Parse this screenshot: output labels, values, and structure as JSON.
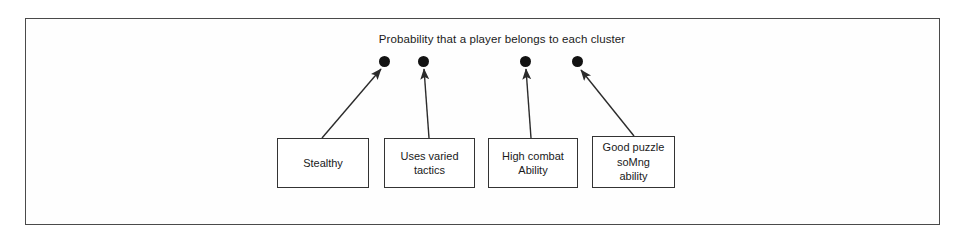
{
  "figure": {
    "title": "Probability that a player belongs to each cluster",
    "border_color": "#4a4a4a",
    "background_color": "#ffffff",
    "ink_color": "#1a1a1a"
  },
  "clusters": [
    {
      "dot_label": "cluster-dot-1",
      "x": 379,
      "y": 56
    },
    {
      "dot_label": "cluster-dot-2",
      "x": 418,
      "y": 56
    },
    {
      "dot_label": "cluster-dot-3",
      "x": 520,
      "y": 56
    },
    {
      "dot_label": "cluster-dot-4",
      "x": 572,
      "y": 56
    }
  ],
  "features": [
    {
      "label": "Stealthy",
      "x": 277,
      "y": 138,
      "width": 92,
      "height": 50
    },
    {
      "label": "Uses varied\ntactics",
      "x": 384,
      "y": 138,
      "width": 91,
      "height": 50
    },
    {
      "label": "High combat\nAbility",
      "x": 488,
      "y": 138,
      "width": 90,
      "height": 50
    },
    {
      "label": "Good puzzle\nsoMng\nability",
      "x": 592,
      "y": 136,
      "width": 83,
      "height": 52
    }
  ],
  "arrows": [
    {
      "name": "arrow-stealthy-to-cluster-1",
      "x1": 322,
      "y1": 138,
      "x2": 381,
      "y2": 69
    },
    {
      "name": "arrow-tactics-to-cluster-2",
      "x1": 429,
      "y1": 138,
      "x2": 424,
      "y2": 69
    },
    {
      "name": "arrow-combat-to-cluster-3",
      "x1": 531,
      "y1": 138,
      "x2": 526,
      "y2": 69
    },
    {
      "name": "arrow-puzzle-to-cluster-4",
      "x1": 634,
      "y1": 136,
      "x2": 581,
      "y2": 70
    }
  ]
}
